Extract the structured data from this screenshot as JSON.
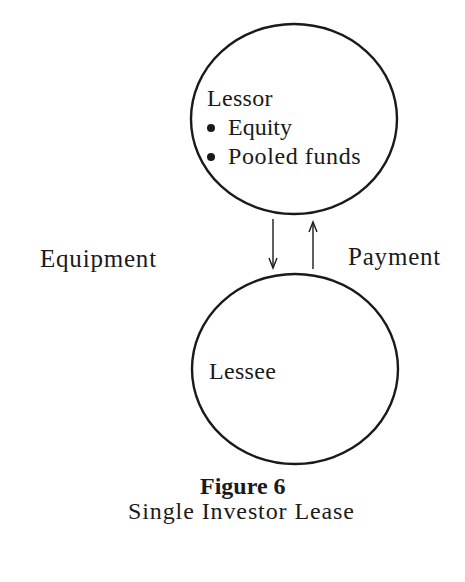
{
  "diagram": {
    "nodes": [
      {
        "id": "lessor",
        "label": "Lessor",
        "bullets": [
          "Equity",
          "Pooled funds"
        ]
      },
      {
        "id": "lessee",
        "label": "Lessee",
        "bullets": []
      }
    ],
    "edges": [
      {
        "from": "lessor",
        "to": "lessee",
        "label": "Equipment",
        "direction": "down"
      },
      {
        "from": "lessee",
        "to": "lessor",
        "label": "Payment",
        "direction": "up"
      }
    ],
    "caption": {
      "title": "Figure 6",
      "subtitle": "Single Investor Lease"
    },
    "colors": {
      "stroke": "#1a1a1a",
      "background": "#ffffff"
    }
  }
}
